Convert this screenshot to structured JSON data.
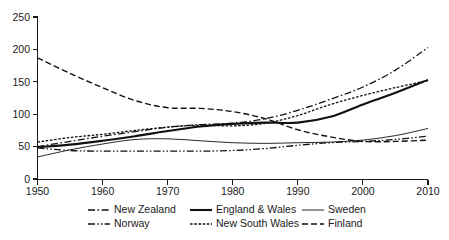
{
  "chart_data": {
    "type": "line",
    "title": "",
    "subtitle": "",
    "xlabel": "",
    "ylabel": "",
    "xlim": [
      1950,
      2010
    ],
    "ylim": [
      0,
      250
    ],
    "xticks": [
      1950,
      1960,
      1970,
      1980,
      1990,
      2000,
      2010
    ],
    "yticks": [
      0,
      50,
      100,
      150,
      200,
      250
    ],
    "xtick_labels": [
      "1950",
      "1960",
      "1970",
      "1980",
      "1990",
      "2000",
      "2010"
    ],
    "ytick_labels": [
      "0",
      "50",
      "100",
      "150",
      "200",
      "250"
    ],
    "grid": false,
    "legend_position": "below-axis",
    "legend_columns": 3,
    "legend_rows": 2,
    "x": [
      1950,
      1955,
      1960,
      1965,
      1970,
      1975,
      1980,
      1985,
      1990,
      1995,
      2000,
      2005,
      2010
    ],
    "series": [
      {
        "name": "New Zealand",
        "style": "dash-dot",
        "color": "#111111",
        "width": 1.3,
        "values": [
          50,
          58,
          66,
          73,
          80,
          84,
          86,
          93,
          106,
          123,
          142,
          168,
          203
        ]
      },
      {
        "name": "Norway",
        "style": "dash-dot-dot",
        "color": "#111111",
        "width": 1.3,
        "values": [
          48,
          44,
          43,
          43,
          43,
          43,
          44,
          47,
          52,
          56,
          58,
          61,
          66
        ]
      },
      {
        "name": "England & Wales",
        "style": "solid-thick",
        "color": "#111111",
        "width": 2.1,
        "values": [
          49,
          53,
          59,
          66,
          74,
          81,
          85,
          87,
          87,
          96,
          115,
          133,
          153
        ]
      },
      {
        "name": "New South Wales",
        "style": "fine-dotted",
        "color": "#111111",
        "width": 1.3,
        "values": [
          57,
          64,
          69,
          75,
          80,
          83,
          82,
          86,
          98,
          115,
          129,
          141,
          152
        ]
      },
      {
        "name": "Sweden",
        "style": "solid-thin",
        "color": "#111111",
        "width": 0.9,
        "values": [
          34,
          45,
          54,
          61,
          62,
          59,
          56,
          55,
          56,
          57,
          60,
          67,
          78
        ]
      },
      {
        "name": "Finland",
        "style": "dashed",
        "color": "#111111",
        "width": 1.4,
        "values": [
          187,
          163,
          141,
          121,
          110,
          109,
          104,
          93,
          76,
          65,
          58,
          58,
          60
        ]
      }
    ]
  },
  "axes": {
    "y_tick_labels": [
      "250",
      "200",
      "150",
      "100",
      "50",
      "0"
    ],
    "x_tick_labels": [
      "1950",
      "1960",
      "1970",
      "1980",
      "1990",
      "2000",
      "2010"
    ]
  },
  "legend": {
    "entries": [
      {
        "label": "New Zealand",
        "style": "dash-dot"
      },
      {
        "label": "England & Wales",
        "style": "solid-thick"
      },
      {
        "label": "Sweden",
        "style": "solid-thin"
      },
      {
        "label": "Norway",
        "style": "dash-dot-dot"
      },
      {
        "label": "New South Wales",
        "style": "fine-dotted"
      },
      {
        "label": "Finland",
        "style": "dashed"
      }
    ]
  }
}
